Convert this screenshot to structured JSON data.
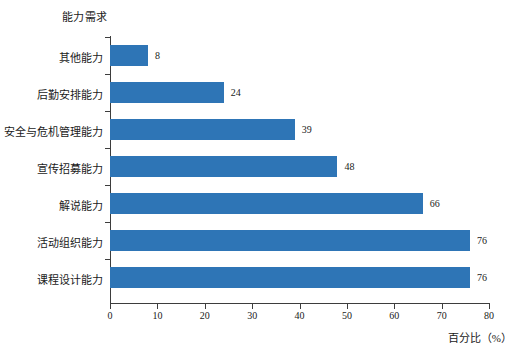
{
  "chart_data": {
    "type": "bar",
    "orientation": "horizontal",
    "title": "能力需求",
    "xlabel": "百分比（%）",
    "ylabel": "能力需求",
    "categories": [
      "其他能力",
      "后勤安排能力",
      "安全与危机管理能力",
      "宣传招募能力",
      "解说能力",
      "活动组织能力",
      "课程设计能力"
    ],
    "values": [
      8,
      24,
      39,
      48,
      66,
      76,
      76
    ],
    "value_labels": [
      "8",
      "24",
      "39",
      "48",
      "66",
      "76",
      "76"
    ],
    "xlim": [
      0,
      80
    ],
    "xticks": [
      0,
      10,
      20,
      30,
      40,
      50,
      60,
      70,
      80
    ],
    "xtick_labels": [
      "0",
      "10",
      "20",
      "30",
      "40",
      "50",
      "60",
      "70",
      "80"
    ],
    "grid": false,
    "legend": null,
    "bar_color": "#2e75b6",
    "axis_color": "#3d3d3d",
    "text_color": "#1a1a1a",
    "background": "#ffffff"
  }
}
